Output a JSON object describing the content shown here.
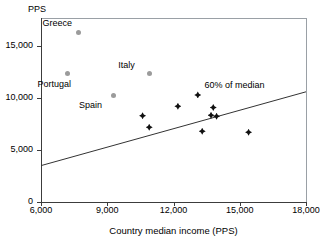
{
  "chart_data": {
    "type": "scatter",
    "title": "",
    "xlabel": "Country median income (PPS)",
    "ylabel": "PPS",
    "xlim": [
      6000,
      18000
    ],
    "ylim": [
      0,
      17700
    ],
    "grid": false,
    "legend": "none",
    "xticks": [
      {
        "value": 6000,
        "label": "6,000"
      },
      {
        "value": 9000,
        "label": "9,000"
      },
      {
        "value": 12000,
        "label": "12,000"
      },
      {
        "value": 15000,
        "label": "15,000"
      },
      {
        "value": 18000,
        "label": "18,000"
      }
    ],
    "yticks": [
      {
        "value": 0,
        "label": "0"
      },
      {
        "value": 5000,
        "label": "5,000"
      },
      {
        "value": 10000,
        "label": "10,000"
      },
      {
        "value": 15000,
        "label": "15,000"
      }
    ],
    "series": [
      {
        "name": "unlabelled-countries",
        "marker": "diamond",
        "color": "#111111",
        "points": [
          {
            "x": 10600,
            "y": 8300
          },
          {
            "x": 10900,
            "y": 7200
          },
          {
            "x": 12200,
            "y": 9200
          },
          {
            "x": 13100,
            "y": 10300
          },
          {
            "x": 13300,
            "y": 6800
          },
          {
            "x": 13800,
            "y": 9100
          },
          {
            "x": 13700,
            "y": 8350
          },
          {
            "x": 13950,
            "y": 8250
          },
          {
            "x": 15400,
            "y": 6700
          }
        ]
      },
      {
        "name": "southern-europe-labelled",
        "marker": "circle",
        "color": "#9b9b9b",
        "points": [
          {
            "x": 7700,
            "y": 16300,
            "label": "Greece",
            "label_dx": -36,
            "label_dy": -15
          },
          {
            "x": 7200,
            "y": 12400,
            "label": "Portugal",
            "label_dx": -30,
            "label_dy": 6
          },
          {
            "x": 9300,
            "y": 10200,
            "label": "Spain",
            "label_dx": -35,
            "label_dy": 4
          },
          {
            "x": 10900,
            "y": 12400,
            "label": "Italy",
            "label_dx": -31,
            "label_dy": -13
          }
        ]
      }
    ],
    "annotations": [
      {
        "name": "trend-line",
        "label": "60% of median",
        "line": {
          "x1": 6000,
          "y1": 3500,
          "x2": 18000,
          "y2": 10600
        },
        "label_x": 13400,
        "label_y": 11300
      }
    ]
  }
}
